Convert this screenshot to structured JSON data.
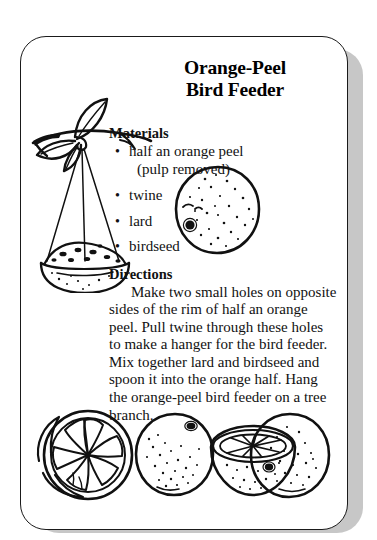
{
  "card": {
    "title_line1": "Orange-Peel",
    "title_line2": "Bird Feeder",
    "materials_heading": "Materials",
    "materials": [
      {
        "text": "half an orange peel",
        "sub": "(pulp removed)"
      },
      {
        "text": "twine",
        "sub": ""
      },
      {
        "text": "lard",
        "sub": ""
      },
      {
        "text": "birdseed",
        "sub": ""
      }
    ],
    "bullet_glyph": "•",
    "directions_heading": "Directions",
    "directions_body": "Make two small holes on opposite sides of the rim of half an orange peel. Pull twine through these holes to make a hanger for the bird feeder. Mix together lard and birdseed and spoon it into the orange half. Hang the orange-peel bird feeder on a tree branch."
  },
  "illustrations": {
    "branch_feeder": "hanging-bowl-feeder-on-branch-illustration",
    "whole_orange": "speckled-orange-illustration",
    "orange_row": "four-oranges-halved-and-whole-illustration"
  },
  "colors": {
    "ink": "#111111",
    "card_background": "#ffffff",
    "card_border": "#1a1a1a",
    "shadow": "#bdbdbd",
    "page_background": "#ffffff"
  }
}
